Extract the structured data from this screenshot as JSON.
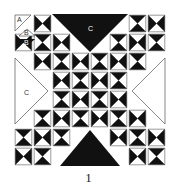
{
  "figure": {
    "caption": "1",
    "labels": {
      "A": "A",
      "B": "B",
      "C": "C"
    },
    "colors": {
      "dark": "#111111",
      "light": "#ffffff",
      "outline": "#555555"
    },
    "block": {
      "origin": [
        14,
        14
      ],
      "size": 152,
      "grid": 8
    }
  }
}
